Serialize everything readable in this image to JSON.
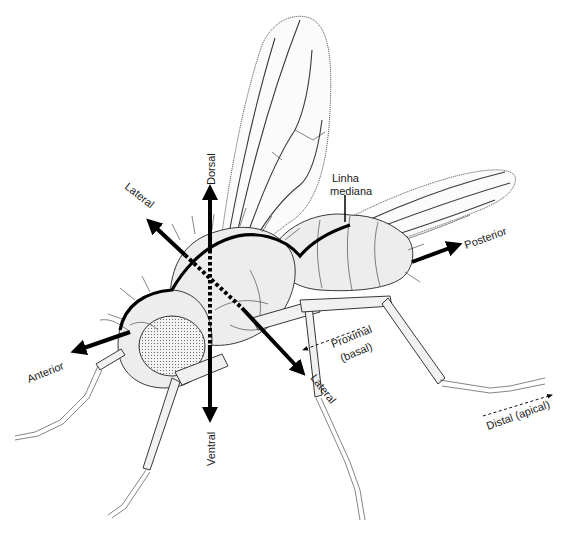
{
  "figure": {
    "language": "Portuguese",
    "labels": {
      "dorsal": "Dorsal",
      "ventral": "Ventral",
      "anterior": "Anterior",
      "posterior": "Posterior",
      "lateral_upper": "Lateral",
      "lateral_lower": "Lateral",
      "linha_mediana_line1": "Linha",
      "linha_mediana_line2": "mediana",
      "proximal_line1": "Proximal",
      "proximal_line2": "(basal)",
      "distal": "Distal (apical)"
    },
    "colors": {
      "background": "#ffffff",
      "ink": "#000000",
      "body_fill": "#ededed"
    }
  }
}
